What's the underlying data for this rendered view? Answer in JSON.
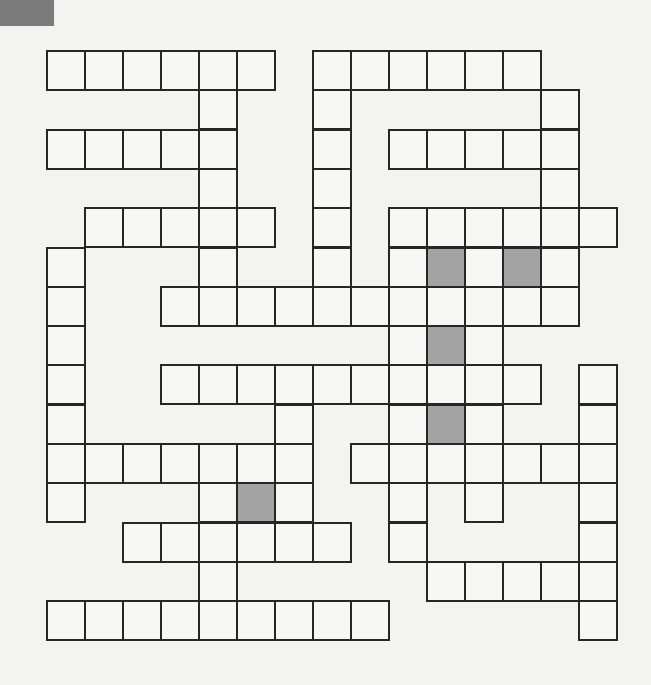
{
  "puzzle": {
    "type": "crossword",
    "rows": 15,
    "cols": 15,
    "cell_width": 38,
    "cell_height": 39.3,
    "colors": {
      "border": "#262626",
      "cell": "#f7f7f5",
      "shaded": "#a3a3a3",
      "corner_mark": "#7b7b7b",
      "background": "#f3f3f1"
    },
    "white_cells_by_row": [
      [
        0,
        1,
        2,
        3,
        4,
        5,
        7,
        8,
        9,
        10,
        11,
        12
      ],
      [
        4,
        7,
        13
      ],
      [
        0,
        1,
        2,
        3,
        4,
        7,
        9,
        10,
        11,
        12,
        13
      ],
      [
        4,
        7,
        13
      ],
      [
        1,
        2,
        3,
        4,
        5,
        7,
        9,
        10,
        11,
        12,
        13,
        14
      ],
      [
        0,
        4,
        7,
        9,
        10,
        11,
        12,
        13
      ],
      [
        0,
        3,
        4,
        5,
        6,
        7,
        8,
        9,
        10,
        11,
        12,
        13
      ],
      [
        0,
        9,
        10,
        11
      ],
      [
        0,
        3,
        4,
        5,
        6,
        7,
        8,
        9,
        10,
        11,
        12,
        14
      ],
      [
        0,
        6,
        9,
        10,
        11,
        14
      ],
      [
        0,
        1,
        2,
        3,
        4,
        5,
        6,
        8,
        9,
        10,
        11,
        12,
        13,
        14
      ],
      [
        0,
        4,
        5,
        6,
        9,
        11,
        14
      ],
      [
        2,
        3,
        4,
        5,
        6,
        7,
        9,
        14
      ],
      [
        4,
        10,
        11,
        12,
        13,
        14
      ],
      [
        0,
        1,
        2,
        3,
        4,
        5,
        6,
        7,
        8,
        14
      ]
    ],
    "shaded_cells": [
      [
        5,
        10
      ],
      [
        5,
        12
      ],
      [
        7,
        10
      ],
      [
        9,
        10
      ],
      [
        11,
        5
      ]
    ]
  }
}
